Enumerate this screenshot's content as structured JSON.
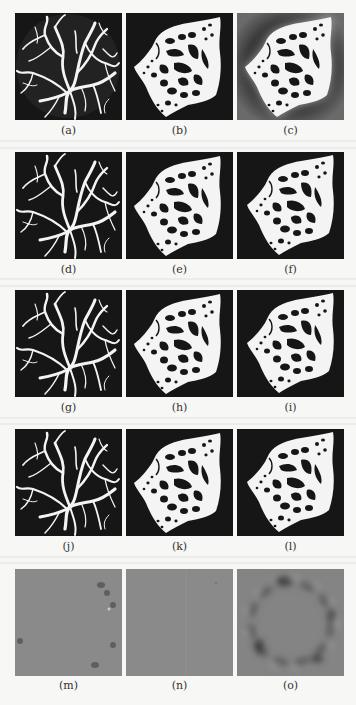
{
  "figure": {
    "columns_x": [
      15,
      126,
      237
    ],
    "rows": [
      {
        "panel_y": 13,
        "caption_y": 125,
        "labels": [
          "(a)",
          "(b)",
          "(c)"
        ],
        "kinds": [
          "vessel-blur",
          "bone-clean",
          "bone-blur"
        ]
      },
      {
        "panel_y": 152,
        "caption_y": 264,
        "labels": [
          "(d)",
          "(e)",
          "(f)"
        ],
        "kinds": [
          "vessel",
          "bone",
          "bone-alt"
        ]
      },
      {
        "panel_y": 290,
        "caption_y": 402,
        "labels": [
          "(g)",
          "(h)",
          "(i)"
        ],
        "kinds": [
          "vessel",
          "bone",
          "bone-alt"
        ]
      },
      {
        "panel_y": 429,
        "caption_y": 541,
        "labels": [
          "(j)",
          "(k)",
          "(l)"
        ],
        "kinds": [
          "vessel",
          "bone",
          "bone-alt"
        ]
      },
      {
        "panel_y": 569,
        "caption_y": 680,
        "labels": [
          "(m)",
          "(n)",
          "(o)"
        ],
        "kinds": [
          "residual-light",
          "residual-flat",
          "residual-ring"
        ]
      }
    ],
    "colors": {
      "panel_dark": "#161616",
      "foreground_white": "#f4f4f4",
      "residual_gray": "#8a8a8a",
      "caption_text": "#333333",
      "page_background": "#f7f7f5"
    }
  }
}
